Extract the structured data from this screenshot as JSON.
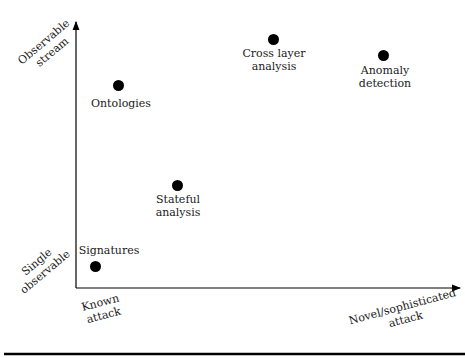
{
  "diagram": {
    "axes": {
      "y_top": {
        "line1": "Observable",
        "line2": "stream"
      },
      "y_bottom": {
        "line1": "Single",
        "line2": "observable"
      },
      "x_left": {
        "line1": "Known",
        "line2": "attack"
      },
      "x_right": {
        "line1": "Novel/sophisticated",
        "line2": "attack"
      }
    },
    "points": [
      {
        "id": "signatures",
        "line1": "Signatures",
        "line2": ""
      },
      {
        "id": "ontologies",
        "line1": "Ontologies",
        "line2": ""
      },
      {
        "id": "stateful",
        "line1": "Stateful",
        "line2": "analysis"
      },
      {
        "id": "cross_layer",
        "line1": "Cross layer",
        "line2": "analysis"
      },
      {
        "id": "anomaly",
        "line1": "Anomaly",
        "line2": "detection"
      }
    ]
  }
}
